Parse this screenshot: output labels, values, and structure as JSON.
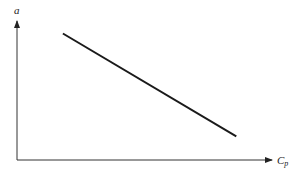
{
  "chart_data": {
    "type": "line",
    "title": "",
    "xlabel": "C_p",
    "ylabel": "a",
    "xlabel_main": "C",
    "xlabel_sub": "p",
    "grid": false,
    "legend": null,
    "ticks": false,
    "series": [
      {
        "name": "a vs C_p",
        "description": "straight line with negative slope (a decreases as C_p increases)",
        "points": [
          {
            "x": 0.18,
            "y": 0.91
          },
          {
            "x": 0.86,
            "y": 0.17
          }
        ]
      }
    ],
    "xlim": [
      0,
      1
    ],
    "ylim": [
      0,
      1
    ],
    "colors": {
      "line": "#1a1a1a",
      "axis": "#333333"
    }
  }
}
